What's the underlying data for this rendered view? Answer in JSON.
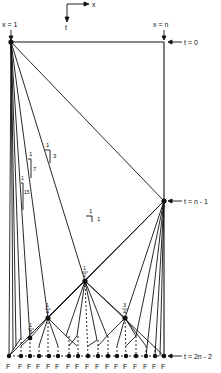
{
  "axes": {
    "x_label": "x",
    "t_label": "t"
  },
  "labels": {
    "x_eq_1": "x = 1",
    "x_eq_n": "x = n",
    "t_eq_0": "t = 0",
    "t_eq_n_minus_1": "t = n - 1",
    "t_eq_2n_minus_2": "t = 2n - 2"
  },
  "slopes": [
    {
      "rise": "1",
      "run": "1"
    },
    {
      "rise": "1",
      "run": "3"
    },
    {
      "rise": "1",
      "run": "7"
    },
    {
      "rise": "1",
      "run": "15"
    }
  ],
  "fractions": {
    "half": {
      "num": "1",
      "den": "2"
    },
    "quarter": {
      "num": "1",
      "den": "4"
    },
    "three_quarter": {
      "num": "3",
      "den": "4"
    },
    "eighth": {
      "num": "1",
      "den": "8"
    }
  },
  "bottom_labels": [
    "F",
    "F",
    "F",
    "F",
    "F",
    "F",
    "F",
    "F",
    "F",
    "F",
    "F",
    "F",
    "F",
    "F",
    "F",
    "F",
    "F"
  ],
  "colors": {
    "ink": "#111111",
    "background": "#ffffff"
  }
}
